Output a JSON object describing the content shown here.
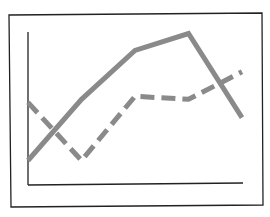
{
  "chart_data": {
    "type": "line",
    "title": "",
    "xlabel": "",
    "ylabel": "",
    "categories": [
      "1",
      "2",
      "3",
      "4",
      "5"
    ],
    "series": [
      {
        "name": "solid",
        "style": "solid",
        "color": "#8a8a8a",
        "values": [
          1.6,
          5.6,
          8.8,
          9.9,
          4.4
        ]
      },
      {
        "name": "dashed",
        "style": "dashed",
        "color": "#8a8a8a",
        "values": [
          5.4,
          1.6,
          5.8,
          5.6,
          7.4
        ]
      }
    ],
    "ylim": [
      0,
      10
    ],
    "grid": false,
    "legend": "none",
    "tick_labels": false
  },
  "colors": {
    "frame": "#222222",
    "axis": "#222222",
    "line": "#8a8a8a",
    "background": "#ffffff"
  }
}
